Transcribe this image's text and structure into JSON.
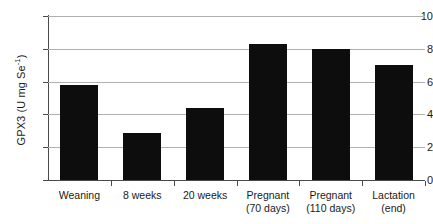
{
  "chart_data": {
    "type": "bar",
    "title": "",
    "xlabel": "",
    "ylabel": "GPX3 (U mg Se⁻¹)",
    "ylabel_main": "GPX3 (U mg Se",
    "ylabel_sup": "-1",
    "ylabel_tail": ")",
    "categories": [
      "Weaning",
      "8 weeks",
      "20 weeks",
      "Pregnant (70 days)",
      "Pregnant (110 days)",
      "Lactation (end)"
    ],
    "category_lines": [
      [
        "Weaning",
        ""
      ],
      [
        "8 weeks",
        ""
      ],
      [
        "20 weeks",
        ""
      ],
      [
        "Pregnant",
        "(70 days)"
      ],
      [
        "Pregnant",
        "(110 days)"
      ],
      [
        "Lactation",
        "(end)"
      ]
    ],
    "values": [
      5.8,
      2.85,
      4.4,
      8.3,
      8.0,
      7.0
    ],
    "ylim": [
      0,
      10
    ],
    "ytick_values": [
      0,
      2,
      4,
      6,
      8,
      10
    ],
    "ytick_labels": [
      "0",
      "2",
      "4",
      "6",
      "8",
      "10"
    ],
    "grid": true,
    "grid_axis": "y",
    "legend": false,
    "bar_color": "#0d0d0d",
    "grid_color": "#b0b0b0",
    "axis_color": "#4a4a4a",
    "background_color": "#ffffff"
  }
}
